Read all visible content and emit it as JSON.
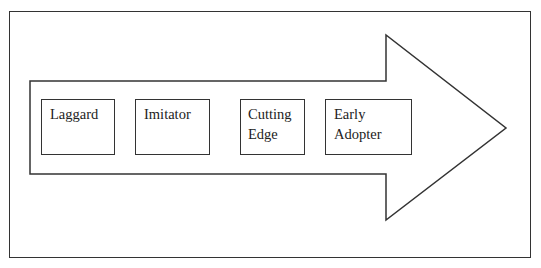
{
  "diagram": {
    "type": "process-arrow",
    "direction": "left-to-right",
    "stages": [
      {
        "label_lines": [
          "Laggard"
        ]
      },
      {
        "label_lines": [
          "Imitator"
        ]
      },
      {
        "label_lines": [
          "Cutting",
          "Edge"
        ]
      },
      {
        "label_lines": [
          "Early",
          "Adopter"
        ]
      }
    ],
    "colors": {
      "stroke": "#333333",
      "fill": "#ffffff"
    }
  }
}
